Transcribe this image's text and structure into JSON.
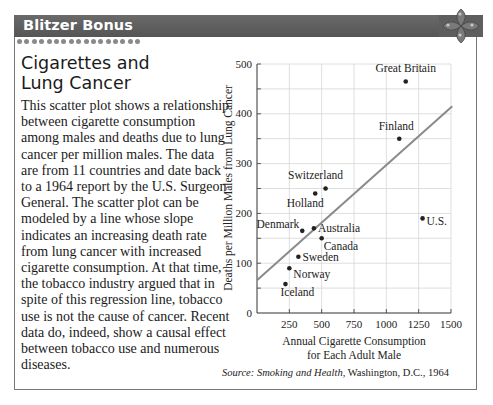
{
  "header": {
    "title": "Blitzer Bonus",
    "icon": "flower-icon",
    "colors": {
      "bar": "#5e5e5e",
      "dots": "#8a8a8a"
    }
  },
  "article": {
    "title_line1": "Cigarettes and",
    "title_line2": "Lung Cancer",
    "body": "This scatter plot shows a relationship between cigarette consumption among males and deaths due to lung cancer per million males. The data are from 11 countries and date back to a 1964 report by the U.S. Surgeon General. The scatter plot can be modeled by a line whose slope indicates an increasing death rate from lung cancer with increased cigarette consumption. At that time, the tobacco industry argued that in spite of this regression line, tobacco use is not the cause of cancer. Recent data do, indeed, show a causal effect between tobacco use and numerous diseases."
  },
  "source": {
    "label": "Source:",
    "title": "Smoking and Health,",
    "rest": "Washington, D.C., 1964"
  },
  "chart_data": {
    "type": "scatter",
    "title": "",
    "xlabel": "Annual Cigarette Consumption for Each Adult Male",
    "xlabel_line1": "Annual Cigarette Consumption",
    "xlabel_line2": "for Each Adult Male",
    "ylabel": "Deaths per Million Males from Lung Cancer",
    "xlim": [
      0,
      1500
    ],
    "ylim": [
      0,
      500
    ],
    "xticks": [
      250,
      500,
      750,
      1000,
      1250,
      1500
    ],
    "yticks": [
      0,
      100,
      200,
      300,
      400,
      500
    ],
    "grid": true,
    "legend": "none",
    "points": [
      {
        "label": "Great Britain",
        "x": 1150,
        "y": 465
      },
      {
        "label": "Finland",
        "x": 1100,
        "y": 350
      },
      {
        "label": "Switzerland",
        "x": 530,
        "y": 250
      },
      {
        "label": "Holland",
        "x": 450,
        "y": 240
      },
      {
        "label": "U.S.",
        "x": 1280,
        "y": 190
      },
      {
        "label": "Denmark",
        "x": 350,
        "y": 165
      },
      {
        "label": "Australia",
        "x": 440,
        "y": 170
      },
      {
        "label": "Canada",
        "x": 500,
        "y": 150
      },
      {
        "label": "Sweden",
        "x": 320,
        "y": 113
      },
      {
        "label": "Norway",
        "x": 250,
        "y": 90
      },
      {
        "label": "Iceland",
        "x": 220,
        "y": 58
      }
    ],
    "regression_line": {
      "x0": 0,
      "y0": 66,
      "x1": 1510,
      "y1": 415,
      "color": "#8a8a8a"
    }
  }
}
